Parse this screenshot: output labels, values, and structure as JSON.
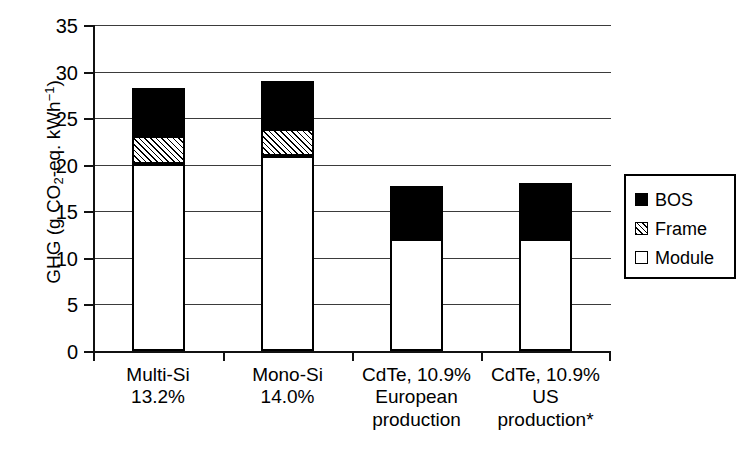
{
  "chart_data": {
    "type": "bar",
    "subtype": "stacked-vertical",
    "title": "",
    "xlabel": "",
    "ylabel": "GHG (g CO2-eq. kWh-1)",
    "ylabel_parts": {
      "prefix": "GHG (g CO",
      "sub": "2",
      "mid": "-eq. kWh",
      "sup": "−1",
      "suffix": ")"
    },
    "ylim": [
      0,
      35
    ],
    "yticks": [
      0,
      5,
      10,
      15,
      20,
      25,
      30,
      35
    ],
    "ytick_labels": [
      "0",
      "5",
      "10",
      "15",
      "20",
      "25",
      "30",
      "35"
    ],
    "grid": true,
    "grid_axis": "y",
    "legend_position": "right",
    "categories": [
      "Multi-Si\n13.2%",
      "Mono-Si\n14.0%",
      "CdTe, 10.9%\nEuropean\nproduction",
      "CdTe, 10.9%\nUS\nproduction*"
    ],
    "series": [
      {
        "name": "Module",
        "values": [
          20.1,
          20.9,
          12.0,
          12.0
        ],
        "fill": "white",
        "color": "#ffffff"
      },
      {
        "name": "Frame",
        "values": [
          3.0,
          2.9,
          0.0,
          0.0
        ],
        "fill": "hatched",
        "color": "#ffffff"
      },
      {
        "name": "BOS",
        "values": [
          5.1,
          5.2,
          5.7,
          6.0
        ],
        "fill": "solid",
        "color": "#000000"
      }
    ],
    "stack_tops": {
      "module": [
        20.1,
        20.9,
        12.0,
        12.0
      ],
      "frame": [
        23.1,
        23.8,
        12.0,
        12.0
      ],
      "bos": [
        28.2,
        29.0,
        17.7,
        18.0
      ]
    },
    "totals": [
      28.2,
      29.0,
      17.7,
      18.0
    ]
  },
  "legend": {
    "items": [
      {
        "label": "BOS",
        "fill": "solid",
        "color": "#000000"
      },
      {
        "label": "Frame",
        "fill": "hatched",
        "color": "#ffffff"
      },
      {
        "label": "Module",
        "fill": "white",
        "color": "#ffffff"
      }
    ]
  },
  "axis": {
    "y_title": "GHG (g CO2-eq. kWh-1)",
    "tick_labels": [
      "35",
      "30",
      "25",
      "20",
      "15",
      "10",
      "5",
      "0"
    ]
  },
  "colors": {
    "bos": "#000000",
    "frame": "#ffffff",
    "module": "#ffffff",
    "axis": "#111111",
    "grid": "#3b3b3b",
    "background": "#ffffff"
  },
  "caption_remnant": ""
}
